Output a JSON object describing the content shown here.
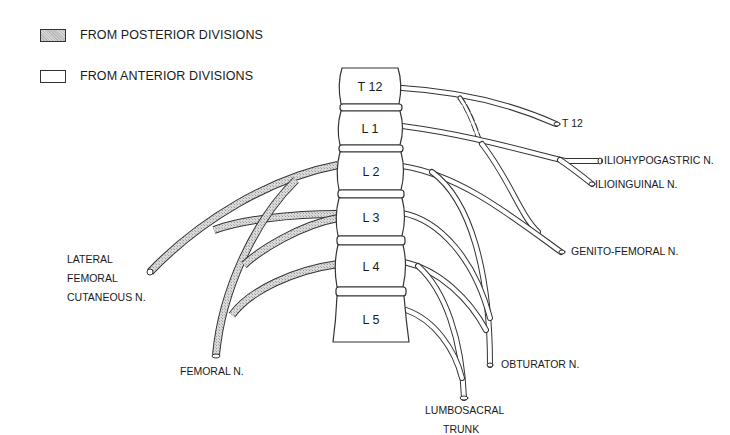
{
  "legend": {
    "items": [
      {
        "label": "FROM POSTERIOR DIVISIONS",
        "fill": "posterior"
      },
      {
        "label": "FROM ANTERIOR DIVISIONS",
        "fill": "anterior"
      }
    ]
  },
  "vertebrae": [
    "T 12",
    "L 1",
    "L 2",
    "L 3",
    "L 4",
    "L 5"
  ],
  "labels": {
    "t12": "T 12",
    "iliohypogastric": "ILIOHYPOGASTRIC N.",
    "ilioinguinal": "ILIOINGUINAL N.",
    "genitofemoral": "GENITO-FEMORAL N.",
    "obturator": "OBTURATOR N.",
    "lumbosacral_1": "LUMBOSACRAL",
    "lumbosacral_2": "TRUNK",
    "lateral_1": "LATERAL",
    "lateral_2": "FEMORAL",
    "lateral_3": "CUTANEOUS N.",
    "femoral": "FEMORAL N."
  },
  "colors": {
    "line": "#333333",
    "posterior_fill": "#cfcfcf",
    "background": "#ffffff"
  }
}
